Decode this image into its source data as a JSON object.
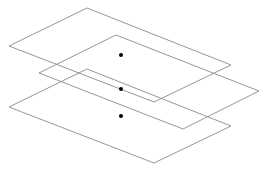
{
  "diagram": {
    "width": 270,
    "height": 172,
    "stroke_color": "#8a8a8a",
    "dot_color": "#000000",
    "planes": [
      {
        "name": "top-plane",
        "points": [
          [
            87,
            8
          ],
          [
            231,
            65
          ],
          [
            154,
            102
          ],
          [
            9,
            46
          ]
        ]
      },
      {
        "name": "middle-plane",
        "points": [
          [
            116,
            35
          ],
          [
            259,
            91
          ],
          [
            183,
            129
          ],
          [
            39,
            73
          ]
        ]
      },
      {
        "name": "bottom-plane",
        "points": [
          [
            87,
            69
          ],
          [
            231,
            126
          ],
          [
            154,
            163
          ],
          [
            9,
            107
          ]
        ]
      }
    ],
    "dots": [
      {
        "name": "top-center-dot",
        "x": 121,
        "y": 55,
        "r": 2
      },
      {
        "name": "middle-center-dot",
        "x": 121,
        "y": 89,
        "r": 2
      },
      {
        "name": "bottom-center-dot",
        "x": 121,
        "y": 116,
        "r": 2
      }
    ]
  }
}
